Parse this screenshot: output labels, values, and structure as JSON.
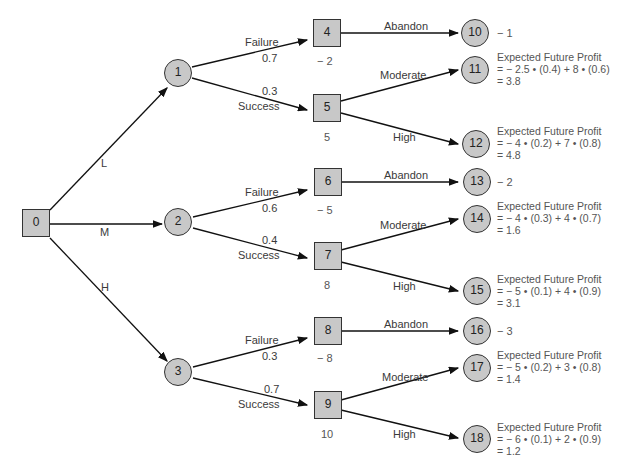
{
  "tree": {
    "root": {
      "id": "0",
      "type": "decision"
    },
    "first_branches": [
      {
        "label": "L",
        "to": "1"
      },
      {
        "label": "M",
        "to": "2"
      },
      {
        "label": "H",
        "to": "3"
      }
    ],
    "chance_nodes": [
      {
        "id": "1",
        "failure": {
          "label": "Failure",
          "prob": "0.7",
          "to": "4"
        },
        "success": {
          "label": "Success",
          "prob": "0.3",
          "to": "5"
        }
      },
      {
        "id": "2",
        "failure": {
          "label": "Failure",
          "prob": "0.6",
          "to": "6"
        },
        "success": {
          "label": "Success",
          "prob": "0.4",
          "to": "7"
        }
      },
      {
        "id": "3",
        "failure": {
          "label": "Failure",
          "prob": "0.3",
          "to": "8"
        },
        "success": {
          "label": "Success",
          "prob": "0.7",
          "to": "9"
        }
      }
    ],
    "decision_nodes": [
      {
        "id": "4",
        "value": "− 2"
      },
      {
        "id": "5",
        "value": "5"
      },
      {
        "id": "6",
        "value": "− 5"
      },
      {
        "id": "7",
        "value": "8"
      },
      {
        "id": "8",
        "value": "− 8"
      },
      {
        "id": "9",
        "value": "10"
      }
    ],
    "leaves": [
      {
        "id": "10",
        "branch": "Abandon",
        "value": "− 1"
      },
      {
        "id": "11",
        "branch": "Moderate",
        "heading": "Expected Future Profit",
        "formula": "=  − 2.5 • (0.4) + 8 • (0.6)",
        "result": "= 3.8"
      },
      {
        "id": "12",
        "branch": "High",
        "heading": "Expected Future Profit",
        "formula": "= − 4 • (0.2) + 7 • (0.8)",
        "result": "= 4.8"
      },
      {
        "id": "13",
        "branch": "Abandon",
        "value": "− 2"
      },
      {
        "id": "14",
        "branch": "Moderate",
        "heading": "Expected Future Profit",
        "formula": "= − 4 • (0.3) + 4 • (0.7)",
        "result": "= 1.6"
      },
      {
        "id": "15",
        "branch": "High",
        "heading": "Expected Future Profit",
        "formula": "= − 5 • (0.1) + 4 • (0.9)",
        "result": "= 3.1"
      },
      {
        "id": "16",
        "branch": "Abandon",
        "value": "− 3"
      },
      {
        "id": "17",
        "branch": "Moderate",
        "heading": "Expected Future Profit",
        "formula": "= − 5 • (0.2) + 3 • (0.8)",
        "result": "= 1.4"
      },
      {
        "id": "18",
        "branch": "High",
        "heading": "Expected Future Profit",
        "formula": "= − 6 • (0.1) + 2 • (0.9)",
        "result": "= 1.2"
      }
    ]
  },
  "colors": {
    "node_fill": "#c8c8c8",
    "stroke": "#222222",
    "text": "#333333"
  }
}
